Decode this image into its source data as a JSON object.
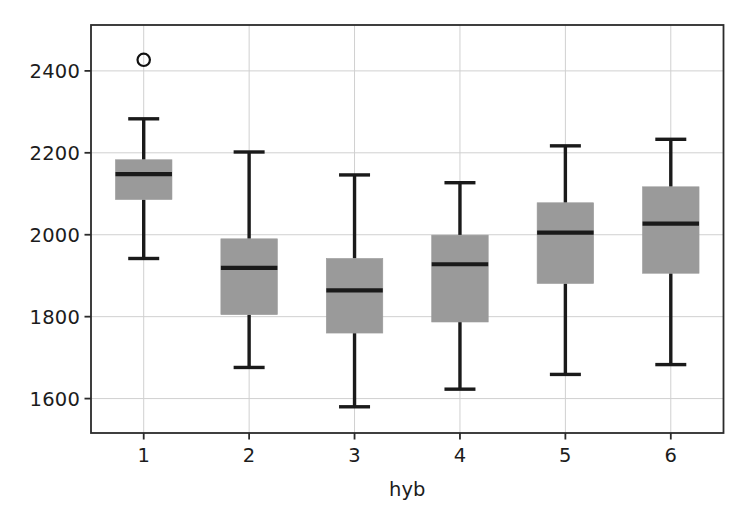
{
  "chart_data": {
    "type": "box",
    "title": "",
    "xlabel": "hyb",
    "ylabel": "",
    "categories": [
      "1",
      "2",
      "3",
      "4",
      "5",
      "6"
    ],
    "xtick_labels": [
      "1",
      "2",
      "3",
      "4",
      "5",
      "6"
    ],
    "ytick_labels": [
      "1600",
      "1800",
      "2000",
      "2200",
      "2400"
    ],
    "ytick_values": [
      1600,
      1800,
      2000,
      2200,
      2400
    ],
    "ylim": [
      1516,
      2512
    ],
    "xlim": [
      0.5,
      6.5
    ],
    "grid": true,
    "grid_axis": "both",
    "legend": null,
    "box_fill_color": "#9a9a9a",
    "line_color": "#1a1a1a",
    "grid_color": "#d0d0d0",
    "boxes": [
      {
        "category": "1",
        "whisker_low": 1942,
        "q1": 2086,
        "median": 2148,
        "q3": 2183,
        "whisker_high": 2283,
        "outliers": [
          2427
        ]
      },
      {
        "category": "2",
        "whisker_low": 1676,
        "q1": 1805,
        "median": 1919,
        "q3": 1990,
        "whisker_high": 2202,
        "outliers": []
      },
      {
        "category": "3",
        "whisker_low": 1580,
        "q1": 1760,
        "median": 1864,
        "q3": 1942,
        "whisker_high": 2146,
        "outliers": []
      },
      {
        "category": "4",
        "whisker_low": 1623,
        "q1": 1787,
        "median": 1928,
        "q3": 1999,
        "whisker_high": 2127,
        "outliers": []
      },
      {
        "category": "5",
        "whisker_low": 1659,
        "q1": 1881,
        "median": 2005,
        "q3": 2078,
        "whisker_high": 2217,
        "outliers": []
      },
      {
        "category": "6",
        "whisker_low": 1683,
        "q1": 1906,
        "median": 2027,
        "q3": 2117,
        "whisker_high": 2233,
        "outliers": []
      }
    ]
  }
}
